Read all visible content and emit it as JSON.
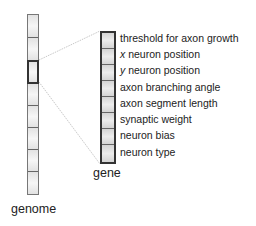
{
  "diagram": {
    "genome": {
      "label": "genome",
      "cell_count": 8,
      "highlighted_index": 2
    },
    "gene": {
      "label": "gene",
      "fields": [
        {
          "prefix": "",
          "text": "threshold for axon growth"
        },
        {
          "prefix": "x",
          "text": " neuron position"
        },
        {
          "prefix": "y",
          "text": " neuron position"
        },
        {
          "prefix": "",
          "text": "axon branching angle"
        },
        {
          "prefix": "",
          "text": "axon segment length"
        },
        {
          "prefix": "",
          "text": "synaptic weight"
        },
        {
          "prefix": "",
          "text": "neuron bias"
        },
        {
          "prefix": "",
          "text": "neuron type"
        }
      ]
    },
    "colors": {
      "background": "#ffffff",
      "cell_fill": "#e8e8e8",
      "border": "#333333",
      "connector": "#bbbbbb"
    }
  }
}
